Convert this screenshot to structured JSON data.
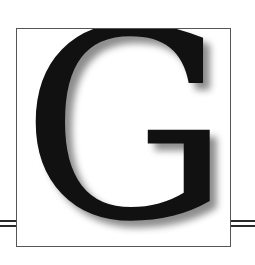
{
  "ornament": {
    "letter": "G",
    "letter_color": "#111111",
    "frame_color": "#555555",
    "rule_color": "#2a2a2a",
    "background": "#ffffff"
  }
}
